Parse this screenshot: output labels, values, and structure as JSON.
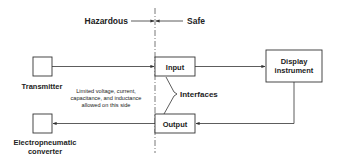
{
  "diagram": {
    "zones": {
      "hazardous_label": "Hazardous",
      "safe_label": "Safe"
    },
    "blocks": {
      "transmitter": "Transmitter",
      "input": "Input",
      "display_line1": "Display",
      "display_line2": "instrument",
      "output": "Output",
      "converter_line1": "Electropneumatic",
      "converter_line2": "converter"
    },
    "annotations": {
      "interfaces": "Interfaces",
      "limit_line1": "Limited voltage, current,",
      "limit_line2": "capacitance, and inductance",
      "limit_line3": "allowed on this side"
    },
    "colors": {
      "line": "#333333",
      "boundary": "#555555",
      "text": "#222222"
    }
  }
}
